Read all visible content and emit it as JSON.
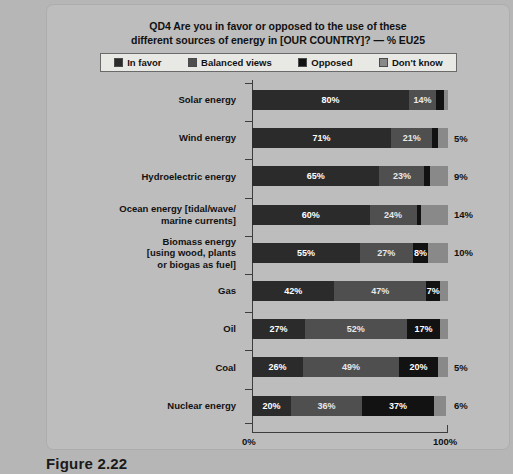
{
  "source_note": "Based on http://ec.europa.eu/public_opinion/archives/ebs/ebs_262_en.pdf",
  "caption": "Figure 2.22",
  "chart_data": {
    "type": "bar",
    "subtype": "stacked-horizontal-100",
    "title": "QD4 Are you in favor or opposed to the use of these different sources of energy in [OUR COUNTRY]? — % EU25",
    "title_line1": "QD4 Are you in favor or opposed to the use of these",
    "title_line2": "different sources of energy in [OUR COUNTRY]? — % EU25",
    "xlabel": "",
    "ylabel": "",
    "xlim": [
      0,
      100
    ],
    "grid": false,
    "legend_position": "top",
    "axis_ticks": [
      "0%",
      "100%"
    ],
    "colors": {
      "in_favor": "#2b2b2b",
      "balanced_views": "#4f4f4f",
      "opposed": "#121212",
      "dont_know": "#898989"
    },
    "legend": [
      {
        "label": "In favor",
        "color": "#2b2b2b"
      },
      {
        "label": "Balanced views",
        "color": "#4f4f4f"
      },
      {
        "label": "Opposed",
        "color": "#121212"
      },
      {
        "label": "Don't know",
        "color": "#898989"
      }
    ],
    "series": [
      {
        "name": "In favor",
        "values": [
          80,
          71,
          65,
          60,
          55,
          42,
          27,
          26,
          20
        ]
      },
      {
        "name": "Balanced views",
        "values": [
          14,
          21,
          23,
          24,
          27,
          47,
          52,
          49,
          36
        ]
      },
      {
        "name": "Opposed",
        "values": [
          4,
          3,
          3,
          2,
          8,
          7,
          17,
          20,
          37
        ]
      },
      {
        "name": "Don't know",
        "values": [
          2,
          5,
          9,
          14,
          10,
          4,
          4,
          5,
          6
        ]
      }
    ],
    "categories": [
      "Solar energy",
      "Wind energy",
      "Hydroelectric energy",
      "Ocean energy [tidal/wave/\nmarine currents]",
      "Biomass energy\n[using wood, plants\nor biogas as fuel]",
      "Gas",
      "Oil",
      "Coal",
      "Nuclear energy"
    ],
    "rows": [
      {
        "label": "Solar energy",
        "segments": [
          {
            "key": "in_favor",
            "value": 80,
            "label": "80%",
            "show": true
          },
          {
            "key": "balanced_views",
            "value": 14,
            "label": "14%",
            "show": true
          },
          {
            "key": "opposed",
            "value": 4,
            "label": "",
            "show": false
          },
          {
            "key": "dont_know",
            "value": 2,
            "label": "",
            "show": false
          }
        ],
        "outside_label": ""
      },
      {
        "label": "Wind energy",
        "segments": [
          {
            "key": "in_favor",
            "value": 71,
            "label": "71%",
            "show": true
          },
          {
            "key": "balanced_views",
            "value": 21,
            "label": "21%",
            "show": true
          },
          {
            "key": "opposed",
            "value": 3,
            "label": "",
            "show": false
          },
          {
            "key": "dont_know",
            "value": 5,
            "label": "",
            "show": false
          }
        ],
        "outside_label": "5%"
      },
      {
        "label": "Hydroelectric energy",
        "segments": [
          {
            "key": "in_favor",
            "value": 65,
            "label": "65%",
            "show": true
          },
          {
            "key": "balanced_views",
            "value": 23,
            "label": "23%",
            "show": true
          },
          {
            "key": "opposed",
            "value": 3,
            "label": "",
            "show": false
          },
          {
            "key": "dont_know",
            "value": 9,
            "label": "",
            "show": false
          }
        ],
        "outside_label": "9%"
      },
      {
        "label": "Ocean energy [tidal/wave/\nmarine currents]",
        "segments": [
          {
            "key": "in_favor",
            "value": 60,
            "label": "60%",
            "show": true
          },
          {
            "key": "balanced_views",
            "value": 24,
            "label": "24%",
            "show": true
          },
          {
            "key": "opposed",
            "value": 2,
            "label": "",
            "show": false
          },
          {
            "key": "dont_know",
            "value": 14,
            "label": "",
            "show": false
          }
        ],
        "outside_label": "14%"
      },
      {
        "label": "Biomass energy\n[using wood, plants\nor biogas as fuel]",
        "segments": [
          {
            "key": "in_favor",
            "value": 55,
            "label": "55%",
            "show": true
          },
          {
            "key": "balanced_views",
            "value": 27,
            "label": "27%",
            "show": true
          },
          {
            "key": "opposed",
            "value": 8,
            "label": "8%",
            "show": true
          },
          {
            "key": "dont_know",
            "value": 10,
            "label": "",
            "show": false
          }
        ],
        "outside_label": "10%"
      },
      {
        "label": "Gas",
        "segments": [
          {
            "key": "in_favor",
            "value": 42,
            "label": "42%",
            "show": true
          },
          {
            "key": "balanced_views",
            "value": 47,
            "label": "47%",
            "show": true
          },
          {
            "key": "opposed",
            "value": 7,
            "label": "7%",
            "show": true
          },
          {
            "key": "dont_know",
            "value": 4,
            "label": "",
            "show": false
          }
        ],
        "outside_label": ""
      },
      {
        "label": "Oil",
        "segments": [
          {
            "key": "in_favor",
            "value": 27,
            "label": "27%",
            "show": true
          },
          {
            "key": "balanced_views",
            "value": 52,
            "label": "52%",
            "show": true
          },
          {
            "key": "opposed",
            "value": 17,
            "label": "17%",
            "show": true
          },
          {
            "key": "dont_know",
            "value": 4,
            "label": "",
            "show": false
          }
        ],
        "outside_label": ""
      },
      {
        "label": "Coal",
        "segments": [
          {
            "key": "in_favor",
            "value": 26,
            "label": "26%",
            "show": true
          },
          {
            "key": "balanced_views",
            "value": 49,
            "label": "49%",
            "show": true
          },
          {
            "key": "opposed",
            "value": 20,
            "label": "20%",
            "show": true
          },
          {
            "key": "dont_know",
            "value": 5,
            "label": "",
            "show": false
          }
        ],
        "outside_label": "5%"
      },
      {
        "label": "Nuclear energy",
        "segments": [
          {
            "key": "in_favor",
            "value": 20,
            "label": "20%",
            "show": true
          },
          {
            "key": "balanced_views",
            "value": 36,
            "label": "36%",
            "show": true
          },
          {
            "key": "opposed",
            "value": 37,
            "label": "37%",
            "show": true
          },
          {
            "key": "dont_know",
            "value": 6,
            "label": "",
            "show": false
          }
        ],
        "outside_label": "6%"
      }
    ]
  }
}
